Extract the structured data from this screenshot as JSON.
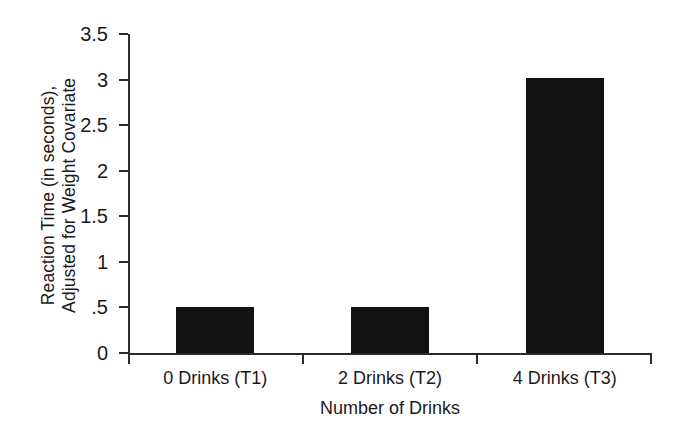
{
  "chart_data": {
    "type": "bar",
    "title": "",
    "xlabel": "Number of Drinks",
    "ylabel_lines": [
      "Reaction Time (in seconds),",
      "Adjusted for Weight Covariate"
    ],
    "ylabel": "Reaction Time (in seconds), Adjusted for Weight Covariate",
    "categories": [
      "0 Drinks (T1)",
      "2 Drinks (T2)",
      "4 Drinks (T3)"
    ],
    "values": [
      0.51,
      0.51,
      3.02
    ],
    "ylim": [
      0,
      3.5
    ],
    "ytick_values": [
      0,
      0.5,
      1,
      1.5,
      2,
      2.5,
      3,
      3.5
    ],
    "ytick_labels": [
      "0",
      ".5",
      "1",
      "1.5",
      "2",
      "2.5",
      "3",
      "3.5"
    ],
    "grid": false,
    "legend": false,
    "legend_position": "none",
    "bar_color": "#121212",
    "axis_color": "#2b2b2b",
    "background_color": "#ffffff"
  }
}
